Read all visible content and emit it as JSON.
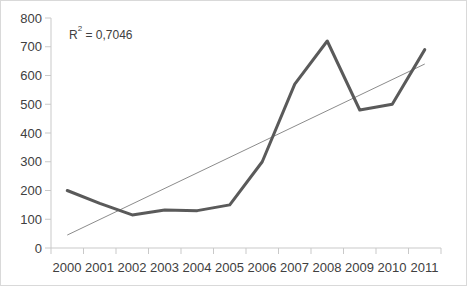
{
  "chart_data": {
    "type": "line",
    "title": "",
    "xlabel": "",
    "ylabel": "",
    "categories": [
      "2000",
      "2001",
      "2002",
      "2003",
      "2004",
      "2005",
      "2006",
      "2007",
      "2008",
      "2009",
      "2010",
      "2011"
    ],
    "series": [
      {
        "name": "data",
        "values": [
          200,
          155,
          115,
          132,
          130,
          150,
          300,
          570,
          720,
          480,
          500,
          690
        ],
        "color": "#5a5a5a",
        "style": "thick-line"
      },
      {
        "name": "linear-trendline",
        "values": [
          45,
          99,
          153,
          207,
          261,
          315,
          369,
          423,
          477,
          531,
          585,
          640
        ],
        "color": "#8c8c8c",
        "style": "thin-line"
      }
    ],
    "ylim": [
      0,
      800
    ],
    "ytick_values": [
      0,
      100,
      200,
      300,
      400,
      500,
      600,
      700,
      800
    ],
    "ytick_labels": [
      "0",
      "100",
      "200",
      "300",
      "400",
      "500",
      "600",
      "700",
      "800"
    ],
    "xtick_labels": [
      "2000",
      "2001",
      "2002",
      "2003",
      "2004",
      "2005",
      "2006",
      "2007",
      "2008",
      "2009",
      "2010",
      "2011"
    ],
    "grid": false,
    "legend": "none",
    "annotations": [
      {
        "name": "r-squared",
        "base": "R",
        "superscript": "2",
        "equals": " = 0,7046",
        "full_text": "R² = 0,7046"
      }
    ],
    "colors": {
      "series": "#5a5a5a",
      "trendline": "#8c8c8c",
      "axis": "#c9c9c9",
      "text": "#404040",
      "border": "#d9d9d9",
      "background": "#ffffff"
    }
  }
}
